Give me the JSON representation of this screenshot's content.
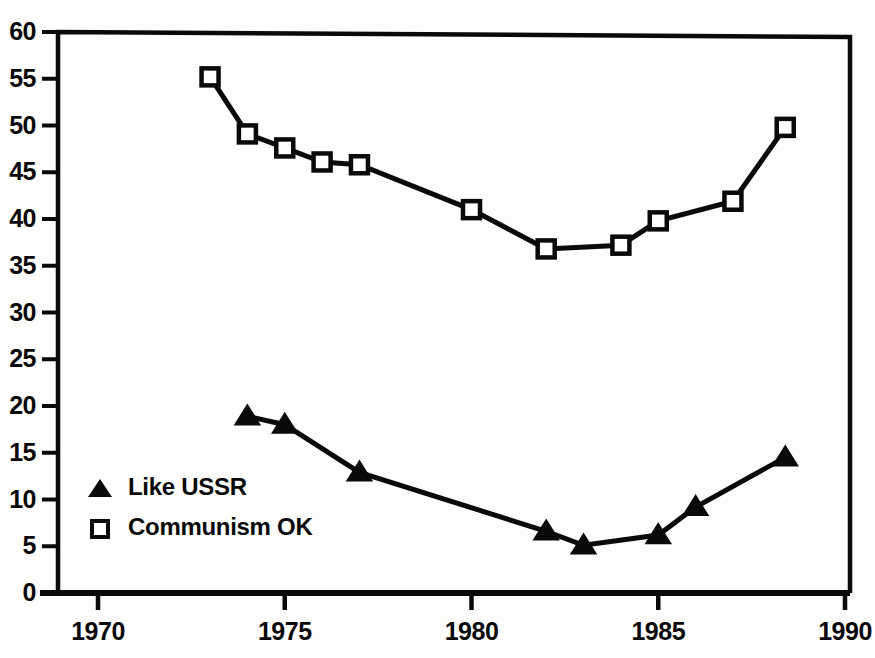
{
  "chart_data": {
    "type": "line",
    "title": "",
    "subtitle": "",
    "xlabel": "",
    "ylabel": "",
    "xlim": [
      1970,
      1990
    ],
    "ylim": [
      0,
      60
    ],
    "x_ticks": [
      1970,
      1975,
      1980,
      1985,
      1990
    ],
    "y_ticks": [
      0,
      5,
      10,
      15,
      20,
      25,
      30,
      35,
      40,
      45,
      50,
      55,
      60
    ],
    "grid": false,
    "legend_position": "inside-lower-left",
    "series": [
      {
        "name": "Like USSR",
        "marker": "filled-triangle",
        "color": "#0a0a0a",
        "points": [
          {
            "x": 1974,
            "y": 18.9
          },
          {
            "x": 1975,
            "y": 18.0
          },
          {
            "x": 1977,
            "y": 12.9
          },
          {
            "x": 1982,
            "y": 6.6
          },
          {
            "x": 1983,
            "y": 5.1
          },
          {
            "x": 1985,
            "y": 6.2
          },
          {
            "x": 1986,
            "y": 9.2
          },
          {
            "x": 1988.4,
            "y": 14.5
          }
        ]
      },
      {
        "name": "Communism OK",
        "marker": "open-square",
        "color": "#0a0a0a",
        "points": [
          {
            "x": 1973,
            "y": 55.2
          },
          {
            "x": 1974,
            "y": 49.1
          },
          {
            "x": 1975,
            "y": 47.6
          },
          {
            "x": 1976,
            "y": 46.1
          },
          {
            "x": 1977,
            "y": 45.8
          },
          {
            "x": 1980,
            "y": 41.0
          },
          {
            "x": 1982,
            "y": 36.8
          },
          {
            "x": 1984,
            "y": 37.2
          },
          {
            "x": 1985,
            "y": 39.8
          },
          {
            "x": 1987,
            "y": 41.9
          },
          {
            "x": 1988.4,
            "y": 49.8
          }
        ]
      }
    ],
    "legend": [
      {
        "label": "Like USSR",
        "marker": "filled-triangle"
      },
      {
        "label": "Communism OK",
        "marker": "open-square"
      }
    ],
    "axis_color": "#0a0a0a",
    "line_color": "#0a0a0a",
    "background": "#fdfdfc"
  }
}
